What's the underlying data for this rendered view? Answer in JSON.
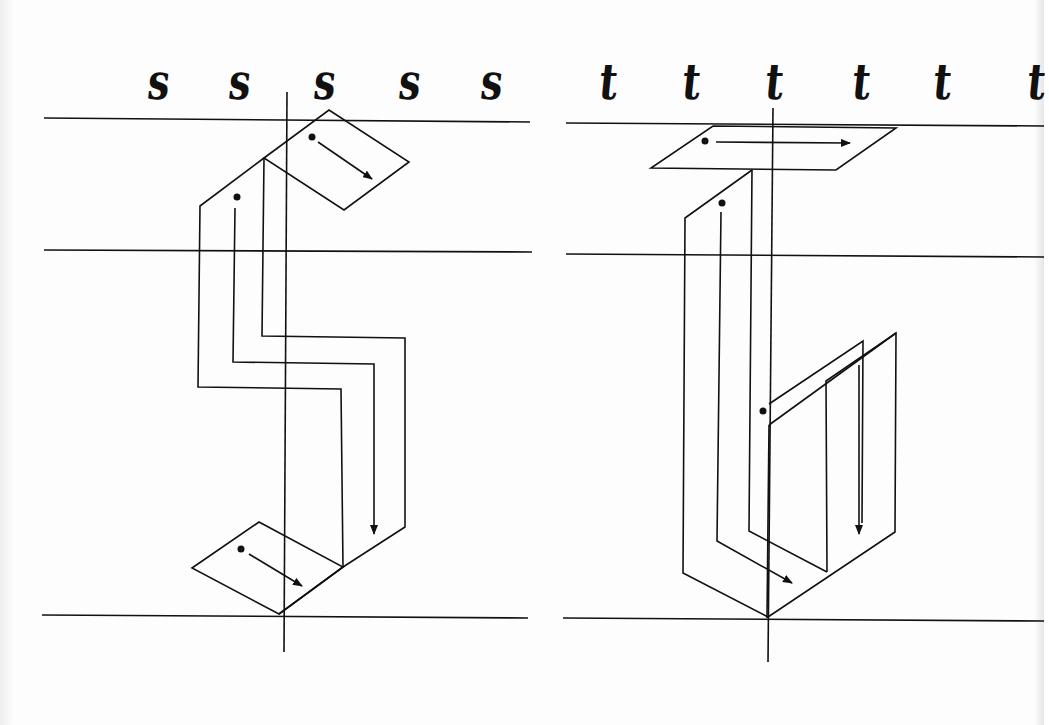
{
  "page": {
    "description": "Blackletter calligraphy stroke-construction diagrams",
    "background": "#fdfdfd",
    "ink": "#111111"
  },
  "panels": [
    {
      "letter": "s",
      "glyph_row": {
        "glyph": "s",
        "count": 5,
        "x_positions": [
          157,
          238,
          323,
          408,
          490
        ]
      },
      "guidelines": {
        "ascender_y": 120,
        "x_height_y": 251,
        "baseline_y": 616,
        "x_start": 44,
        "x_end": 530
      },
      "slant_axis": {
        "x_top": 287,
        "y_top": 93,
        "x_bottom": 284,
        "y_bottom": 652
      },
      "strokes": [
        {
          "order": 1,
          "label": "top-diagonal-stroke",
          "start": [
            312,
            137
          ],
          "end": [
            372,
            180
          ]
        },
        {
          "order": 2,
          "label": "spine-stroke",
          "start": [
            236,
            197
          ],
          "end": [
            373,
            534
          ]
        },
        {
          "order": 3,
          "label": "bottom-diagonal-stroke",
          "start": [
            243,
            549
          ],
          "end": [
            302,
            583
          ]
        }
      ]
    },
    {
      "letter": "t",
      "glyph_row": {
        "glyph": "t",
        "count": 6,
        "x_positions": [
          607,
          690,
          773,
          860,
          941,
          1030
        ]
      },
      "guidelines": {
        "ascender_y": 124,
        "x_height_y": 255,
        "baseline_y": 620,
        "x_start": 566,
        "x_end": 1044
      },
      "slant_axis": {
        "x_top": 772,
        "y_top": 108,
        "x_bottom": 768,
        "y_bottom": 662
      },
      "strokes": [
        {
          "order": 1,
          "label": "crossbar-stroke",
          "start": [
            705,
            140
          ],
          "end": [
            850,
            142
          ]
        },
        {
          "order": 2,
          "label": "stem-stroke",
          "start": [
            722,
            203
          ],
          "end": [
            792,
            580
          ]
        },
        {
          "order": 3,
          "label": "right-hairline-stroke",
          "start": [
            763,
            411
          ],
          "end": [
            858,
            535
          ]
        }
      ]
    }
  ]
}
